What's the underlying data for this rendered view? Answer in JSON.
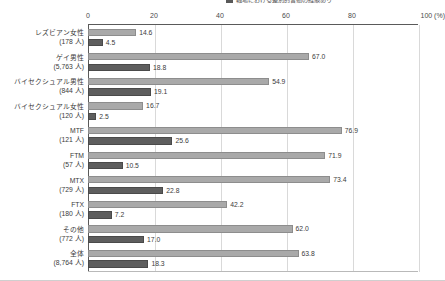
{
  "legend": {
    "items": [
      {
        "label": "職場における差別的言動の経験あり",
        "color": "#595959",
        "swatch": "legend-swatch-dark"
      }
    ]
  },
  "axis": {
    "unit": "(%)",
    "ticks": [
      "0",
      "20",
      "40",
      "60",
      "80",
      "100"
    ],
    "tick_values": [
      0,
      20,
      40,
      60,
      80,
      100
    ],
    "min": 0,
    "max": 100,
    "unit_tick_label": "100 (%)"
  },
  "chart_data": {
    "type": "bar",
    "orientation": "horizontal",
    "title": "",
    "subtitle": "",
    "xlabel": "(%)",
    "ylabel": "",
    "xlim": [
      0,
      100
    ],
    "grid": true,
    "legend_position": "top-right",
    "categories": [
      "レズビアン女性",
      "ゲイ男性",
      "バイセクシュアル男性",
      "バイセクシュアル女性",
      "MTF",
      "FTM",
      "MTX",
      "FTX",
      "その他",
      "全体"
    ],
    "category_counts": [
      "(178 人)",
      "(5,763 人)",
      "(844 人)",
      "(120 人)",
      "(121 人)",
      "(57 人)",
      "(729 人)",
      "(180 人)",
      "(772 人)",
      "(8,764 人)"
    ],
    "series": [
      {
        "name": "series-light",
        "color": "#a9a9a9",
        "values": [
          14.6,
          67.0,
          54.9,
          16.7,
          76.9,
          71.9,
          73.4,
          42.2,
          62.0,
          63.8
        ],
        "labels": [
          "14.6",
          "67.0",
          "54.9",
          "16.7",
          "76.9",
          "71.9",
          "73.4",
          "42.2",
          "62.0",
          "63.8"
        ]
      },
      {
        "name": "series-dark",
        "color": "#5e5e5e",
        "values": [
          4.5,
          18.8,
          19.1,
          2.5,
          25.6,
          10.5,
          22.8,
          7.2,
          17.0,
          18.3
        ],
        "labels": [
          "4.5",
          "18.8",
          "19.1",
          "2.5",
          "25.6",
          "10.5",
          "22.8",
          "7.2",
          "17.0",
          "18.3"
        ]
      }
    ]
  },
  "colors": {
    "light_bar": "#a9a9a9",
    "dark_bar": "#5e5e5e",
    "gridline": "#d9d9d9",
    "axis": "#5a5a5a",
    "text": "#3a3a3a"
  }
}
